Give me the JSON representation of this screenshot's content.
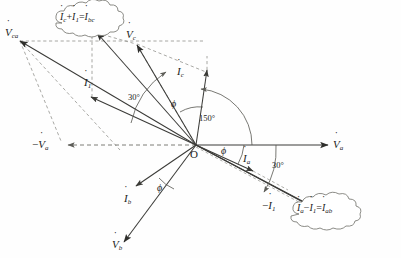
{
  "diagram": {
    "origin_label": "O",
    "line_color": "#3b3b38",
    "dash_color": "#8a8a85",
    "text_color": "#1c1c1c"
  },
  "vectors": [
    {
      "id": "Va",
      "base": "V",
      "sub": "a",
      "sign": "",
      "dotted_over": true,
      "kind": "voltage",
      "angle_deg": 0,
      "length": 200,
      "label": "V",
      "subscript": "a"
    },
    {
      "id": "Vb",
      "base": "V",
      "sub": "b",
      "sign": "",
      "dotted_over": true,
      "kind": "voltage",
      "angle_deg": -110,
      "length": 125,
      "label": "V",
      "subscript": "b"
    },
    {
      "id": "Vc",
      "base": "V",
      "sub": "c",
      "sign": "",
      "dotted_over": true,
      "kind": "voltage",
      "angle_deg": 121,
      "length": 110,
      "label": "V",
      "subscript": "c"
    },
    {
      "id": "Vca",
      "base": "V",
      "sub": "ca",
      "sign": "",
      "dotted_over": true,
      "kind": "voltage",
      "angle_deg": 152,
      "length": 200,
      "label": "V",
      "subscript": "ca"
    },
    {
      "id": "negVa",
      "base": "V",
      "sub": "a",
      "sign": "−",
      "dotted_over": true,
      "kind": "voltage-neg",
      "angle_deg": 180,
      "length": 150,
      "label": "V",
      "subscript": "a"
    },
    {
      "id": "Ia",
      "base": "I",
      "sub": "a",
      "sign": "",
      "dotted_over": true,
      "kind": "current",
      "angle_deg": -22,
      "length": 175,
      "label": "I",
      "subscript": "a"
    },
    {
      "id": "Ib",
      "base": "I",
      "sub": "b",
      "sign": "",
      "dotted_over": true,
      "kind": "current",
      "angle_deg": -143,
      "length": 72,
      "label": "I",
      "subscript": "b"
    },
    {
      "id": "Ic",
      "base": "I",
      "sub": "c",
      "sign": "",
      "dotted_over": true,
      "kind": "current",
      "angle_deg": 98,
      "length": 80,
      "label": "I",
      "subscript": "c"
    },
    {
      "id": "I1",
      "base": "I",
      "sub": "1",
      "sign": "",
      "dotted_over": true,
      "kind": "current",
      "angle_deg": 152,
      "length": 105,
      "label": "I",
      "subscript": "1"
    },
    {
      "id": "negI1",
      "base": "I",
      "sub": "1",
      "sign": "−",
      "dotted_over": true,
      "kind": "current-neg",
      "angle_deg": -28,
      "length": 140,
      "label": "I",
      "subscript": "1"
    }
  ],
  "labels": {
    "Va": {
      "sign": "",
      "base": "V",
      "sub": "a"
    },
    "Vb": {
      "sign": "",
      "base": "V",
      "sub": "b"
    },
    "Vc": {
      "sign": "",
      "base": "V",
      "sub": "c"
    },
    "Vca": {
      "sign": "",
      "base": "V",
      "sub": "ca"
    },
    "negVa": {
      "sign": "−",
      "base": "V",
      "sub": "a"
    },
    "Ia": {
      "sign": "",
      "base": "I",
      "sub": "a"
    },
    "Ib": {
      "sign": "",
      "base": "I",
      "sub": "b"
    },
    "Ic": {
      "sign": "",
      "base": "I",
      "sub": "c"
    },
    "I1": {
      "sign": "",
      "base": "I",
      "sub": "1"
    },
    "negI1": {
      "sign": "−",
      "base": "I",
      "sub": "1"
    },
    "origin": "O"
  },
  "angles": [
    {
      "id": "phi-ia",
      "text": "ϕ",
      "at": "between Va and Ia"
    },
    {
      "id": "phi-ib",
      "text": "ϕ",
      "at": "between Vb and Ib"
    },
    {
      "id": "phi-ic",
      "text": "ϕ",
      "at": "between Vc and Ic"
    },
    {
      "id": "deg150",
      "text": "150°",
      "at": "between Va and Ic"
    },
    {
      "id": "deg30-top",
      "text": "30°",
      "at": "between I1 and Ibc resultant"
    },
    {
      "id": "deg30-bot",
      "text": "30°",
      "at": "between Va and Iab resultant"
    }
  ],
  "callouts": [
    {
      "id": "cloud-top",
      "text": "İc + İ1 = İbc",
      "parts": {
        "t1": "I",
        "s1": "c",
        "op1": "+",
        "t2": "I",
        "s2": "1",
        "eq": "=",
        "t3": "I",
        "s3": "bc"
      }
    },
    {
      "id": "cloud-bottom",
      "text": "İa − İ1 = İab",
      "parts": {
        "t1": "I",
        "s1": "a",
        "op1": "−",
        "t2": "I",
        "s2": "1",
        "eq": "=",
        "t3": "I",
        "s3": "ab"
      }
    }
  ]
}
